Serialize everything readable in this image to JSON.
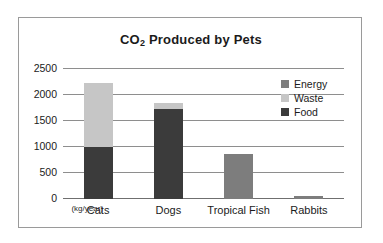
{
  "chart_data": {
    "type": "bar",
    "subtype": "stacked",
    "title": "CO2 Produced by Pets",
    "title_prefix": "CO",
    "title_subscript": "2",
    "title_suffix": " Produced by Pets",
    "xlabel": "",
    "ylabel": "",
    "unit_label": "(kg/year)",
    "categories": [
      "Cats",
      "Dogs",
      "Tropical Fish",
      "Rabbits"
    ],
    "series": [
      {
        "name": "Food",
        "color": "#3b3b3b",
        "values": [
          1000,
          1730,
          0,
          0
        ]
      },
      {
        "name": "Waste",
        "color": "#c6c6c6",
        "values": [
          1230,
          110,
          0,
          0
        ]
      },
      {
        "name": "Energy",
        "color": "#7d7d7d",
        "values": [
          0,
          0,
          870,
          60
        ]
      }
    ],
    "legend_order": [
      "Energy",
      "Waste",
      "Food"
    ],
    "totals": [
      2230,
      1840,
      870,
      60
    ],
    "yticks": [
      0,
      500,
      1000,
      1500,
      2000,
      2500
    ],
    "ytick_labels": [
      "0",
      "500",
      "1000",
      "1500",
      "2000",
      "2500"
    ],
    "ylim": [
      0,
      2500
    ],
    "grid": true,
    "legend_position": "upper right"
  },
  "legend": {
    "items": [
      {
        "label": "Energy",
        "color": "#7d7d7d"
      },
      {
        "label": "Waste",
        "color": "#c6c6c6"
      },
      {
        "label": "Food",
        "color": "#3b3b3b"
      }
    ]
  }
}
